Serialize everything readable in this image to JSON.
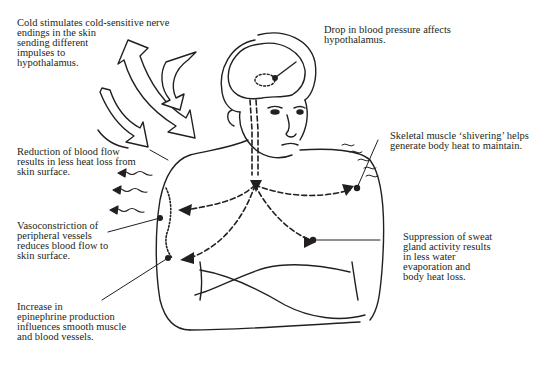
{
  "diagram": {
    "labels": {
      "cold_stimulus": "Cold stimulates cold-sensitive nerve\nendings in the skin\nsending different\nimpulses to\nhypothalamus.",
      "blood_pressure": "Drop in blood pressure affects\nhypothalamus.",
      "shivering": "Skeletal muscle ‘shivering’ helps\ngenerate body heat to maintain.",
      "reduced_blood_flow": "Reduction of blood flow\nresults in less heat loss from\nskin surface.",
      "vasoconstriction": "Vasoconstriction of\nperipheral vessels\nreduces blood flow to\nskin surface.",
      "sweat_suppression": "Suppression of sweat\ngland activity results\nin less water\nevaporation and\nbody heat loss.",
      "epinephrine": "Increase in\nepinephrine production\ninfluences smooth muscle\nand blood vessels."
    },
    "icons": {
      "cold_arrows": "curved-block-arrows-icon",
      "heat_loss_arrows": "wavy-arrows-icon",
      "nerve_path": "dashed-arrow-path",
      "hypothalamus": "dotted-oval-icon"
    },
    "colors": {
      "ink": "#231f20",
      "background": "#ffffff"
    }
  }
}
